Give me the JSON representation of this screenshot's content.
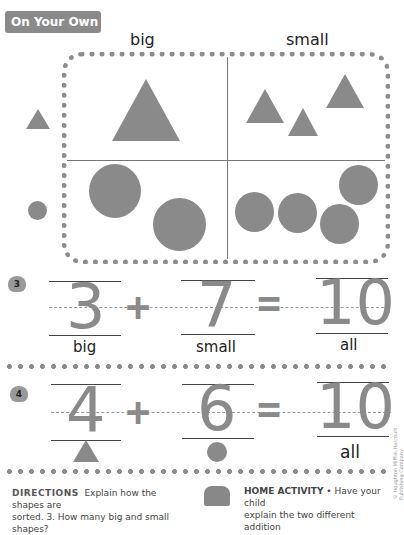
{
  "header": {
    "title": "On Your Own"
  },
  "sorting": {
    "column_labels": [
      "big",
      "small"
    ],
    "row_shapes": [
      "triangle",
      "circle"
    ],
    "cells": {
      "triangle_big": 1,
      "triangle_small": 3,
      "circle_big": 2,
      "circle_small": 4
    }
  },
  "items": [
    {
      "number": "3",
      "badge_icon": "tree-icon",
      "addend1": "3",
      "plus": "+",
      "addend2": "7",
      "equals": "=",
      "sum": "10",
      "labels": [
        "big",
        "small",
        "all"
      ]
    },
    {
      "number": "4",
      "badge_icon": "bird-icon",
      "addend1": "4",
      "plus": "+",
      "addend2": "6",
      "equals": "=",
      "sum": "10",
      "labels": [
        "",
        "",
        "all"
      ],
      "shape_hints": [
        "triangle",
        "circle"
      ]
    }
  ],
  "footer": {
    "directions_label": "DIRECTIONS",
    "directions_text": "Explain how the shapes are",
    "directions_text2": "sorted.  3. How many big and small shapes?",
    "home_activity_label": "HOME ACTIVITY",
    "home_activity_text": "• Have your child",
    "home_activity_text2": "explain the two different addition",
    "copyright": "© Houghton Mifflin Harcourt Publishing Company"
  }
}
